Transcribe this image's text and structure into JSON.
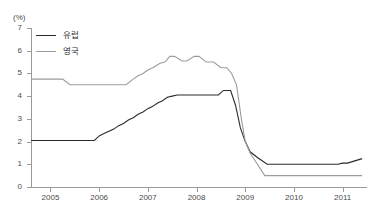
{
  "chart_data": {
    "type": "line",
    "title": "",
    "xlabel": "",
    "ylabel": "",
    "unit_label": "(%)",
    "ylim": [
      0,
      7
    ],
    "xlim": [
      2004.6,
      2011.5
    ],
    "ytick_labels": [
      "7",
      "6",
      "5",
      "4",
      "3",
      "2",
      "1",
      "0"
    ],
    "ytick_values": [
      7,
      6,
      5,
      4,
      3,
      2,
      1,
      0
    ],
    "xtick_labels": [
      "2005",
      "2006",
      "2007",
      "2008",
      "2009",
      "2010",
      "2011"
    ],
    "xtick_values": [
      2005,
      2006,
      2007,
      2008,
      2009,
      2010,
      2011
    ],
    "grid": false,
    "legend_position": "top-left",
    "series": [
      {
        "name": "유럽",
        "color": "#2b2b2b",
        "x": [
          2004.6,
          2005.0,
          2005.5,
          2005.9,
          2006.0,
          2006.1,
          2006.2,
          2006.3,
          2006.4,
          2006.5,
          2006.6,
          2006.7,
          2006.8,
          2006.9,
          2007.0,
          2007.1,
          2007.2,
          2007.3,
          2007.4,
          2007.5,
          2007.6,
          2007.7,
          2008.0,
          2008.45,
          2008.55,
          2008.7,
          2008.8,
          2008.9,
          2009.0,
          2009.1,
          2009.25,
          2009.45,
          2010.0,
          2010.6,
          2010.9,
          2011.0,
          2011.1,
          2011.25,
          2011.4
        ],
        "values": [
          2.05,
          2.05,
          2.05,
          2.05,
          2.25,
          2.35,
          2.45,
          2.55,
          2.7,
          2.8,
          2.95,
          3.05,
          3.2,
          3.3,
          3.45,
          3.55,
          3.7,
          3.8,
          3.95,
          4.0,
          4.05,
          4.05,
          4.05,
          4.05,
          4.25,
          4.25,
          3.6,
          2.6,
          2.0,
          1.55,
          1.3,
          1.0,
          1.0,
          1.0,
          1.0,
          1.05,
          1.05,
          1.15,
          1.25
        ]
      },
      {
        "name": "영국",
        "color": "#9b9b9b",
        "x": [
          2004.6,
          2005.25,
          2005.4,
          2006.0,
          2006.55,
          2006.7,
          2006.8,
          2006.9,
          2007.0,
          2007.1,
          2007.25,
          2007.35,
          2007.45,
          2007.55,
          2007.7,
          2007.8,
          2007.95,
          2008.05,
          2008.2,
          2008.35,
          2008.5,
          2008.62,
          2008.72,
          2008.82,
          2008.92,
          2009.0,
          2009.1,
          2009.25,
          2009.4,
          2010.0,
          2010.5,
          2011.0,
          2011.4
        ],
        "values": [
          4.75,
          4.75,
          4.5,
          4.5,
          4.5,
          4.75,
          4.9,
          5.0,
          5.15,
          5.25,
          5.45,
          5.5,
          5.75,
          5.75,
          5.55,
          5.55,
          5.75,
          5.75,
          5.5,
          5.5,
          5.25,
          5.25,
          5.0,
          4.5,
          3.0,
          2.0,
          1.5,
          1.0,
          0.5,
          0.5,
          0.5,
          0.5,
          0.5
        ]
      }
    ]
  },
  "legend": {
    "items": [
      {
        "label": "유럽",
        "color": "#2b2b2b"
      },
      {
        "label": "영국",
        "color": "#9b9b9b"
      }
    ]
  }
}
